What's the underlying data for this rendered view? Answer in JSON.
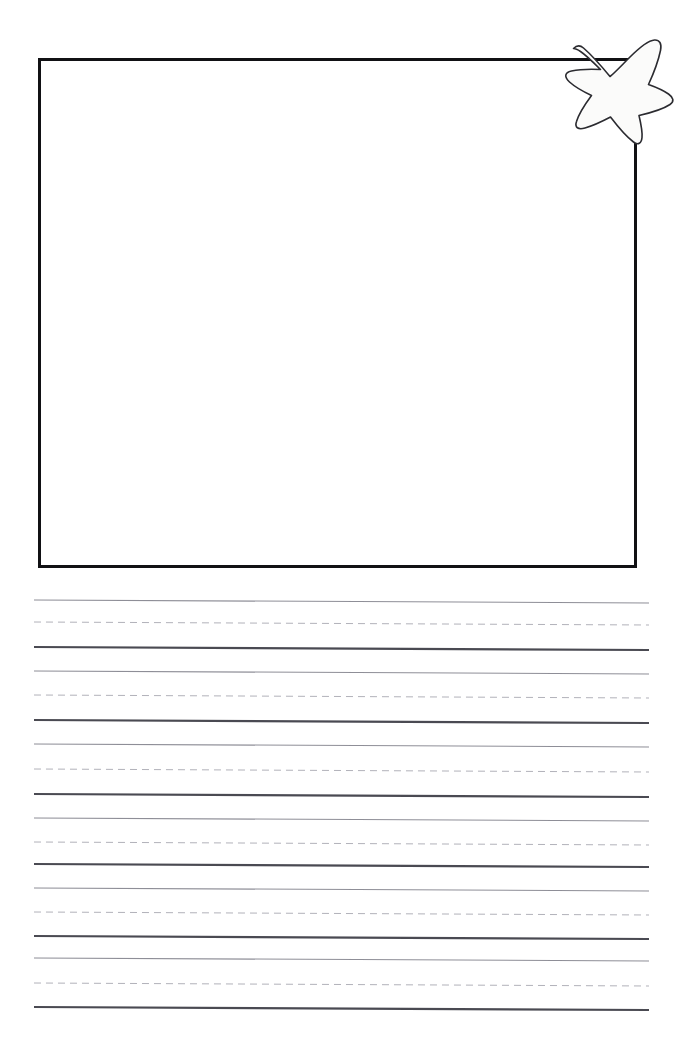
{
  "page": {
    "width": 681,
    "height": 1042,
    "background_color": "#ffffff",
    "paper_type": "draw-and-write primary ruled paper",
    "orientation": "portrait"
  },
  "drawing_box": {
    "name": "illustration-box",
    "label": "",
    "placeholder_text": "",
    "x": 38,
    "y": 58,
    "width": 599,
    "height": 510,
    "border_color": "#111114",
    "border_width": 3,
    "fill_color": "#ffffff",
    "is_empty": true
  },
  "star_sticker": {
    "name": "star-sticker",
    "label": "",
    "x": 560,
    "y": 32,
    "width": 116,
    "height": 116,
    "points": 5,
    "fill_color": "#fbfbfa",
    "outline_color": "#2b2b30",
    "outline_width": 1.6,
    "style": "hand-drawn irregular star",
    "overlaps": "top-right corner of drawing box"
  },
  "ruled_lines": {
    "name": "handwriting-rules",
    "left_x": 34,
    "right_x": 649,
    "slope_drop_px": 3,
    "group_count": 6,
    "lines_per_group": 3,
    "group_period_px": 68,
    "first_line_y": 600,
    "colors": {
      "top_line": "#8e8e97",
      "mid_dashed": "#b2b2ba",
      "baseline": "#4a4a52"
    },
    "widths": {
      "top_line": 1.1,
      "mid_dashed": 1.0,
      "baseline": 2.2
    },
    "dash_pattern": "7 5",
    "groups": [
      {
        "index": 1,
        "top_y": 600,
        "mid_y": 622,
        "base_y": 647
      },
      {
        "index": 2,
        "top_y": 671,
        "mid_y": 695,
        "base_y": 720
      },
      {
        "index": 3,
        "top_y": 744,
        "mid_y": 769,
        "base_y": 794
      },
      {
        "index": 4,
        "top_y": 818,
        "mid_y": 842,
        "base_y": 864
      },
      {
        "index": 5,
        "top_y": 888,
        "mid_y": 912,
        "base_y": 936
      },
      {
        "index": 6,
        "top_y": 958,
        "mid_y": 983,
        "base_y": 1007
      }
    ]
  }
}
